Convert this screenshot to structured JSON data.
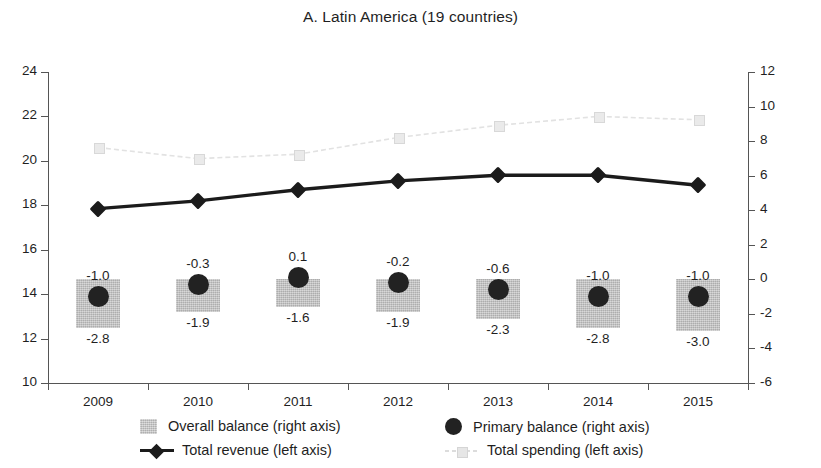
{
  "chart_data": {
    "type": "line",
    "title": "A. Latin America (19 countries)",
    "xlabel": "",
    "ylabel": "",
    "grid": false,
    "legend_position": "bottom",
    "categories": [
      "2009",
      "2010",
      "2011",
      "2012",
      "2013",
      "2014",
      "2015"
    ],
    "axes": {
      "left": {
        "name": "left axis",
        "ylim": [
          10,
          24
        ],
        "ticks": [
          10,
          12,
          14,
          16,
          18,
          20,
          22,
          24
        ],
        "tick_labels": [
          "10",
          "12",
          "14",
          "16",
          "18",
          "20",
          "22",
          "24"
        ]
      },
      "right": {
        "name": "right axis",
        "ylim": [
          -6,
          12
        ],
        "ticks": [
          -6,
          -4,
          -2,
          0,
          2,
          4,
          6,
          8,
          10,
          12
        ],
        "tick_labels": [
          "-6",
          "-4",
          "-2",
          "0",
          "2",
          "4",
          "6",
          "8",
          "10",
          "12"
        ]
      }
    },
    "series": [
      {
        "name": "Overall balance (right axis)",
        "legend_label": "Overall balance (right axis)",
        "axis": "right",
        "type": "bar",
        "marker": "filled-square-texture",
        "color": "#c2c2c2",
        "values": [
          -2.8,
          -1.9,
          -1.6,
          -1.9,
          -2.3,
          -2.8,
          -3.0
        ],
        "data_labels": [
          "-2.8",
          "-1.9",
          "-1.6",
          "-1.9",
          "-2.3",
          "-2.8",
          "-3.0"
        ]
      },
      {
        "name": "Primary balance (right axis)",
        "legend_label": "Primary balance (right axis)",
        "axis": "right",
        "type": "scatter",
        "marker": "filled-circle",
        "color": "#222222",
        "values": [
          -1.0,
          -0.3,
          0.1,
          -0.2,
          -0.6,
          -1.0,
          -1.0
        ],
        "data_labels": [
          "-1.0",
          "-0.3",
          "0.1",
          "-0.2",
          "-0.6",
          "-1.0",
          "-1.0"
        ]
      },
      {
        "name": "Total revenue (left axis)",
        "legend_label": "Total revenue (left axis)",
        "axis": "left",
        "type": "line",
        "marker": "filled-diamond",
        "color": "#1b1b1b",
        "values": [
          17.85,
          18.2,
          18.7,
          19.1,
          19.35,
          19.35,
          18.9
        ]
      },
      {
        "name": "Total spending (left axis)",
        "legend_label": "Total spending (left axis)",
        "axis": "left",
        "type": "line",
        "marker": "open-square",
        "color": "#e2e2e2",
        "values": [
          20.6,
          20.1,
          20.3,
          21.05,
          21.6,
          22.0,
          21.85
        ]
      }
    ]
  },
  "legend": {
    "items": [
      {
        "label": "Overall balance (right axis)",
        "marker": "swatch"
      },
      {
        "label": "Primary balance (right axis)",
        "marker": "dot"
      },
      {
        "label": "Total revenue (left axis)",
        "marker": "line-diamond"
      },
      {
        "label": "Total spending (left axis)",
        "marker": "line-square"
      }
    ]
  }
}
